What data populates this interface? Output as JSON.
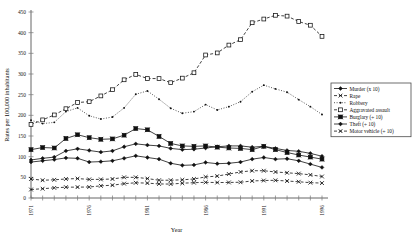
{
  "chart_data": {
    "type": "line",
    "title": "",
    "xlabel": "Year",
    "ylabel": "Rates per 100,000 inhabitants",
    "xlim": [
      1971,
      1996
    ],
    "ylim": [
      0,
      450
    ],
    "grid": false,
    "legend_position": "right",
    "x_tick_labels": [
      "1971",
      "1976",
      "1981",
      "1986",
      "1991",
      "1996"
    ],
    "x_tick_values": [
      1971,
      1976,
      1981,
      1986,
      1991,
      1996
    ],
    "y_tick_labels": [
      "0",
      "50",
      "100",
      "150",
      "200",
      "250",
      "300",
      "350",
      "400",
      "450"
    ],
    "y_tick_values": [
      0,
      50,
      100,
      150,
      200,
      250,
      300,
      350,
      400,
      450
    ],
    "x": [
      1971,
      1972,
      1973,
      1974,
      1975,
      1976,
      1977,
      1978,
      1979,
      1980,
      1981,
      1982,
      1983,
      1984,
      1985,
      1986,
      1987,
      1988,
      1989,
      1990,
      1991,
      1992,
      1993,
      1994,
      1995,
      1996
    ],
    "series": [
      {
        "name": "Murder (x 10)",
        "marker": "filled-diamond",
        "line": "solid",
        "values": [
          87,
          90,
          93,
          97,
          96,
          87,
          88,
          90,
          96,
          102,
          98,
          94,
          84,
          79,
          80,
          86,
          83,
          84,
          87,
          94,
          98,
          94,
          95,
          90,
          82,
          74
        ]
      },
      {
        "name": "Rape",
        "marker": "x-cross",
        "line": "dashed",
        "values": [
          20.5,
          22.5,
          24.5,
          26.2,
          26.3,
          26.6,
          29.4,
          31.0,
          34.7,
          36.8,
          36.0,
          34.0,
          33.7,
          35.7,
          37.1,
          37.9,
          37.4,
          37.6,
          38.1,
          41.2,
          42.3,
          42.8,
          41.1,
          39.3,
          37.1,
          36.1
        ]
      },
      {
        "name": "Robbery",
        "marker": "small-dot",
        "line": "dotted",
        "values": [
          188,
          180,
          183,
          209,
          218,
          199,
          191,
          196,
          218,
          251,
          259,
          239,
          217,
          205,
          209,
          226,
          213,
          221,
          233,
          257,
          273,
          264,
          256,
          238,
          221,
          202
        ]
      },
      {
        "name": "Aggravated assault",
        "marker": "open-square",
        "line": "dashed",
        "values": [
          178,
          189,
          201,
          216,
          231,
          233,
          247,
          262,
          286,
          299,
          289,
          289,
          279,
          290,
          303,
          346,
          351,
          370,
          383,
          424,
          433,
          442,
          440,
          427,
          418,
          391
        ]
      },
      {
        "name": "Burglary (÷ 10)",
        "marker": "filled-square-cross",
        "line": "solid",
        "values": [
          117,
          122,
          121,
          144,
          153,
          146,
          142,
          143,
          152,
          168,
          165,
          149,
          132,
          126,
          125,
          126,
          123,
          121,
          120,
          117,
          125,
          117,
          110,
          104,
          99,
          94
        ]
      },
      {
        "name": "Theft (÷ 10)",
        "marker": "filled-diamond",
        "line": "solid",
        "values": [
          92,
          96,
          99,
          114,
          119,
          115,
          111,
          114,
          124,
          131,
          128,
          126,
          120,
          117,
          118,
          121,
          124,
          126,
          126,
          123,
          125,
          120,
          115,
          113,
          108,
          101
        ]
      },
      {
        "name": "Motor vehicle (÷ 10)",
        "marker": "x-cross",
        "line": "dashed",
        "values": [
          46,
          43,
          44,
          46,
          47,
          45,
          45,
          46,
          50,
          50,
          47,
          43,
          43,
          44,
          46,
          51,
          53,
          58,
          63,
          66,
          66,
          63,
          61,
          59,
          56,
          52
        ]
      }
    ]
  },
  "legend": {
    "items": [
      {
        "label": "Murder (x 10)"
      },
      {
        "label": "Rape"
      },
      {
        "label": "Robbery"
      },
      {
        "label": "Aggravated assault"
      },
      {
        "label": "Burglary (÷ 10)"
      },
      {
        "label": "Theft (÷ 10)"
      },
      {
        "label": "Motor vehicle (÷ 10)"
      }
    ]
  },
  "colors": {
    "ink": "#111111",
    "axis": "#555555",
    "background": "#ffffff"
  }
}
